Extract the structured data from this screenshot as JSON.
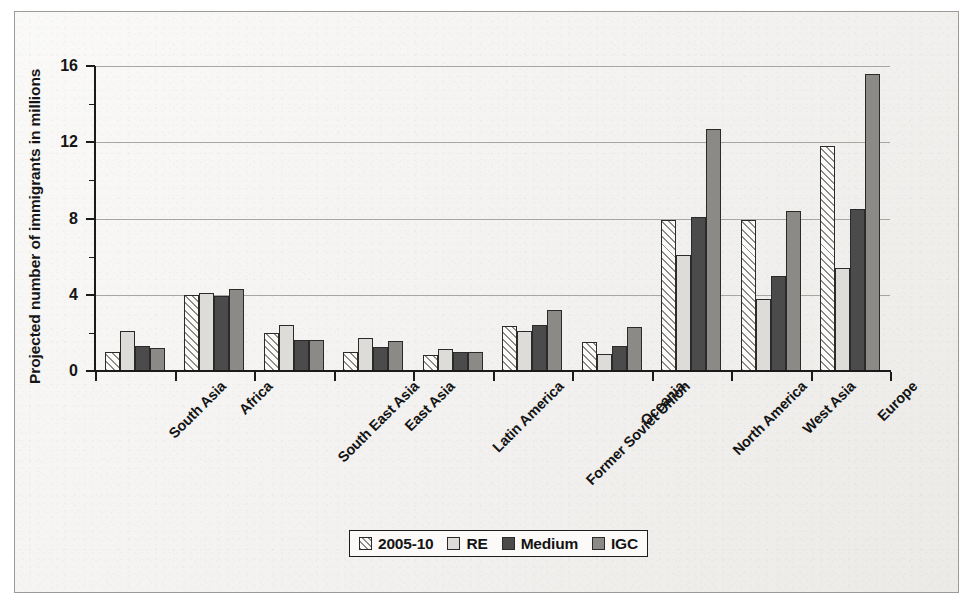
{
  "chart_data": {
    "type": "bar",
    "title": "",
    "xlabel": "",
    "ylabel": "Projected number of immigrants in millions",
    "ylim": [
      0,
      16
    ],
    "yticks": [
      0,
      4,
      8,
      12,
      16
    ],
    "ytick_labels": [
      "0",
      "4",
      "8",
      "12",
      "16"
    ],
    "grid": true,
    "grid_axis": "y",
    "legend_position": "bottom-center",
    "categories": [
      "South Asia",
      "Africa",
      "South East Asia",
      "East Asia",
      "Latin America",
      "Former Soviet Union",
      "Oceania",
      "North America",
      "West Asia",
      "Europe"
    ],
    "series": [
      {
        "name": "2005-10",
        "style": "diagonal-hatch",
        "color": "#fbfbfa",
        "values": [
          1.0,
          4.0,
          2.0,
          1.0,
          0.85,
          2.35,
          1.5,
          7.9,
          7.9,
          11.8
        ]
      },
      {
        "name": "RE",
        "style": "light-grey",
        "color": "#dedcd8",
        "values": [
          2.1,
          4.1,
          2.4,
          1.75,
          1.15,
          2.1,
          0.9,
          6.1,
          3.8,
          5.4
        ]
      },
      {
        "name": "Medium",
        "style": "dark-grey",
        "color": "#4b4b4b",
        "values": [
          1.3,
          3.95,
          1.65,
          1.25,
          1.0,
          2.4,
          1.3,
          8.1,
          5.0,
          8.5
        ]
      },
      {
        "name": "IGC",
        "style": "mid-grey",
        "color": "#8b8a87",
        "values": [
          1.2,
          4.3,
          1.65,
          1.6,
          1.0,
          3.2,
          2.3,
          12.7,
          8.4,
          15.6
        ]
      }
    ]
  },
  "legend": {
    "items": [
      {
        "label": "2005-10"
      },
      {
        "label": "RE"
      },
      {
        "label": "Medium"
      },
      {
        "label": "IGC"
      }
    ]
  }
}
